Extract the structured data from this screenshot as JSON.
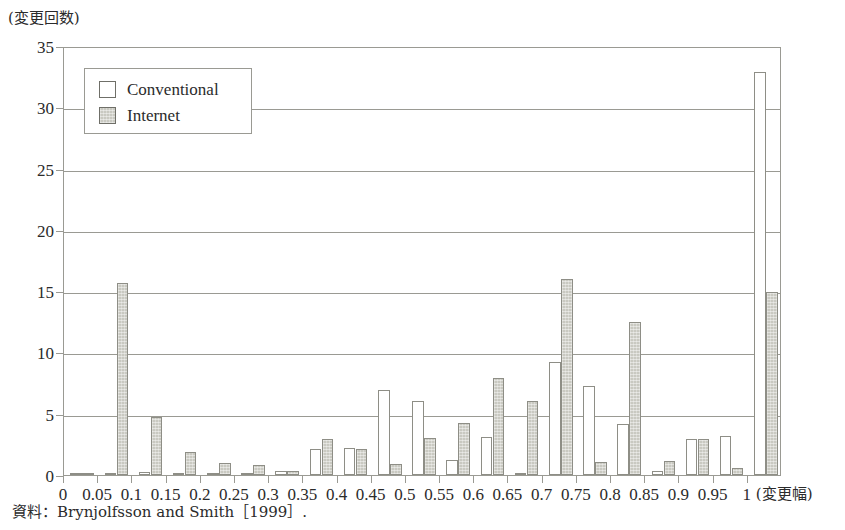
{
  "chart_data": {
    "type": "bar",
    "title": "",
    "subtitle": "",
    "ylabel": "(変更回数)",
    "xlabel": "(変更幅)",
    "grid": true,
    "ylim": [
      0,
      35
    ],
    "ytick_step": 5,
    "ytick_labels": [
      "0",
      "5",
      "10",
      "15",
      "20",
      "25",
      "30",
      "35"
    ],
    "categories": [
      "0",
      "0.05",
      "0.1",
      "0.15",
      "0.2",
      "0.25",
      "0.3",
      "0.35",
      "0.4",
      "0.45",
      "0.5",
      "0.55",
      "0.6",
      "0.65",
      "0.7",
      "0.75",
      "0.8",
      "0.85",
      "0.9",
      "0.95",
      "1"
    ],
    "legend_position": "top-left-inside",
    "series": [
      {
        "name": "Conventional",
        "color": "#ffffff",
        "values": [
          0.15,
          0.2,
          0.25,
          0.2,
          0.2,
          0.2,
          0.3,
          2.1,
          2.2,
          6.9,
          6.0,
          1.2,
          3.1,
          0.2,
          9.2,
          7.3,
          4.2,
          0.3,
          2.9,
          3.2,
          32.9
        ]
      },
      {
        "name": "Internet",
        "color": "#c9c9c1",
        "values": [
          0.1,
          15.7,
          4.7,
          1.85,
          1.0,
          0.8,
          0.35,
          2.9,
          2.15,
          0.9,
          3.0,
          4.25,
          7.9,
          6.0,
          16.0,
          1.1,
          12.5,
          1.15,
          2.95,
          0.55,
          14.9
        ]
      }
    ]
  },
  "legend": {
    "items": [
      {
        "label": "Conventional",
        "swatch": "conventional"
      },
      {
        "label": "Internet",
        "swatch": "internet"
      }
    ]
  },
  "source": {
    "note": "資料：Brynjolfsson and Smith［1999］."
  }
}
